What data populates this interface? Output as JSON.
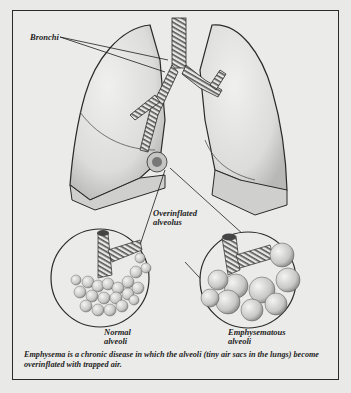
{
  "figure": {
    "labels": {
      "bronchi": "Bronchi",
      "overinflated_alveolus_line1": "Overinflated",
      "overinflated_alveolus_line2": "alveolus",
      "normal_alveoli_line1": "Normal",
      "normal_alveoli_line2": "alveoli",
      "emphysematous_alveoli_line1": "Emphysematous",
      "emphysematous_alveoli_line2": "alveoli"
    },
    "caption": "Emphysema is a chronic disease in which the alveoli (tiny air sacs in the lungs) become overinflated with trapped air.",
    "colors": {
      "background": "#e9e9e7",
      "ink": "#2a2a2a",
      "shading": "#bdbdbb"
    }
  }
}
